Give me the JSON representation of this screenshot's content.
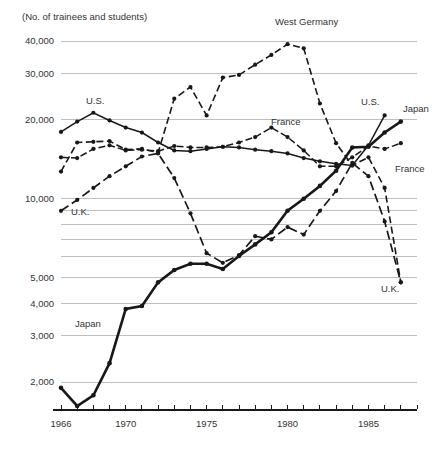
{
  "chart_data": {
    "type": "line",
    "title": "(No. of trainees and students)",
    "xlabel": "",
    "ylabel": "",
    "yscale": "log",
    "ylim": [
      1500,
      44000
    ],
    "xlim": [
      1966,
      1988
    ],
    "grid": true,
    "legend_position": "inline-annotations",
    "ytick_labels": [
      "40,000",
      "30,000",
      "20,000",
      "10,000",
      "5,000",
      "4,000",
      "3,000",
      "2,000"
    ],
    "ytick_values": [
      40000,
      30000,
      20000,
      10000,
      5000,
      4000,
      3000,
      2000
    ],
    "ygrid_unlabeled_values": [
      9000,
      8000,
      7000,
      6000
    ],
    "xtick_labels": [
      "1966",
      "1970",
      "1975",
      "1980",
      "1985"
    ],
    "xtick_values": [
      1966,
      1970,
      1975,
      1980,
      1985
    ],
    "xtick_minor_values": [
      1967,
      1968,
      1969,
      1971,
      1972,
      1973,
      1974,
      1976,
      1977,
      1978,
      1979,
      1981,
      1982,
      1983,
      1984,
      1986,
      1987,
      1988
    ],
    "series": [
      {
        "name": "Japan",
        "style": "solid",
        "stroke_width": 2.6,
        "x": [
          1966,
          1967,
          1968,
          1969,
          1970,
          1971,
          1972,
          1973,
          1974,
          1975,
          1976,
          1977,
          1978,
          1979,
          1980,
          1981,
          1982,
          1983,
          1984,
          1985,
          1986,
          1987
        ],
        "values": [
          1900,
          1620,
          1780,
          2360,
          3800,
          3900,
          4800,
          5350,
          5650,
          5650,
          5400,
          6050,
          6700,
          7450,
          9000,
          10000,
          11200,
          12800,
          15700,
          15800,
          17900,
          19700
        ]
      },
      {
        "name": "U.S.",
        "style": "solid-thin",
        "stroke_width": 1.5,
        "x": [
          1966,
          1967,
          1968,
          1969,
          1970,
          1971,
          1972,
          1973,
          1974,
          1975,
          1976,
          1977,
          1978,
          1979,
          1980,
          1981,
          1982,
          1983,
          1984,
          1985,
          1986
        ],
        "values": [
          18000,
          19700,
          21300,
          19900,
          18700,
          17900,
          16400,
          15300,
          15200,
          15500,
          15800,
          15700,
          15400,
          15200,
          14900,
          14300,
          13900,
          13600,
          13400,
          16000,
          20800
        ]
      },
      {
        "name": "West Germany",
        "style": "dashed",
        "stroke_width": 1.6,
        "x": [
          1966,
          1967,
          1968,
          1969,
          1970,
          1971,
          1972,
          1973,
          1974,
          1975,
          1976,
          1977,
          1978,
          1979,
          1980,
          1981,
          1982,
          1983,
          1984,
          1985,
          1986,
          1987
        ],
        "values": [
          12700,
          16400,
          16500,
          16600,
          15400,
          15500,
          15000,
          24100,
          26700,
          20800,
          29000,
          29700,
          32500,
          35400,
          38900,
          37500,
          23100,
          16300,
          13400,
          14400,
          11000,
          4800
        ]
      },
      {
        "name": "France",
        "style": "dash-dot",
        "stroke_width": 1.5,
        "x": [
          1966,
          1967,
          1968,
          1969,
          1970,
          1971,
          1972,
          1973,
          1974,
          1975,
          1976,
          1977,
          1978,
          1979,
          1980,
          1981,
          1982,
          1983,
          1984,
          1985,
          1986,
          1987
        ],
        "values": [
          14400,
          14300,
          15500,
          16000,
          15300,
          15400,
          15200,
          15900,
          15700,
          15700,
          15800,
          16400,
          17200,
          18700,
          17200,
          15300,
          13300,
          13300,
          14400,
          15900,
          15500,
          16300
        ]
      },
      {
        "name": "U.K.",
        "style": "long-dash",
        "stroke_width": 1.7,
        "x": [
          1966,
          1967,
          1968,
          1969,
          1970,
          1971,
          1972,
          1973,
          1974,
          1975,
          1976,
          1977,
          1978,
          1979,
          1980,
          1981,
          1982,
          1983,
          1984,
          1985,
          1986,
          1987
        ],
        "values": [
          9000,
          9900,
          11000,
          12200,
          13300,
          14500,
          14900,
          12000,
          8800,
          6200,
          5700,
          6100,
          7200,
          7000,
          7800,
          7300,
          9000,
          10700,
          13700,
          12200,
          8200,
          4800
        ]
      }
    ],
    "annotations": [
      {
        "label": "West Germany",
        "x": 275,
        "y": 25
      },
      {
        "label": "U.S.",
        "x": 86,
        "y": 104
      },
      {
        "label": "U.K.",
        "x": 71,
        "y": 215
      },
      {
        "label": "Japan",
        "x": 75,
        "y": 327
      },
      {
        "label": "France",
        "x": 271,
        "y": 125
      },
      {
        "label": "U.S.",
        "x": 361,
        "y": 105
      },
      {
        "label": "Japan",
        "x": 403,
        "y": 112
      },
      {
        "label": "France",
        "x": 395,
        "y": 172
      },
      {
        "label": "U.K.",
        "x": 381,
        "y": 292
      }
    ]
  },
  "colors": {
    "ink": "#181818",
    "grid": "#b8b8b8",
    "text": "#333333",
    "background": "#ffffff"
  }
}
